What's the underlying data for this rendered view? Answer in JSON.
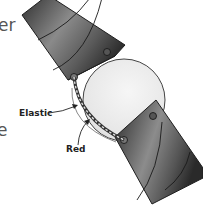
{
  "diagram": {
    "cut_off_text": {
      "top": "er",
      "middle": "l",
      "lower": "e"
    },
    "labels": {
      "elastic": "Elastic",
      "rod": "Red"
    },
    "colors": {
      "tube_dark": "#3a3a3a",
      "tube_light": "#9a9a9a",
      "ball": "#ececec",
      "outline": "#1e1e1e",
      "label_text": "#222222",
      "cut_text": "#555555"
    }
  }
}
